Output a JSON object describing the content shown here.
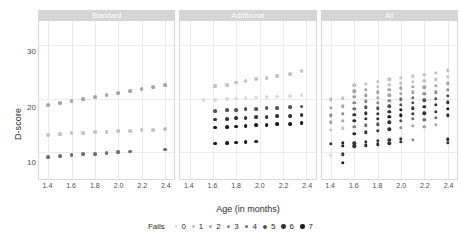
{
  "chart_data": {
    "type": "scatter",
    "title": "",
    "xlabel": "Age (in months)",
    "ylabel": "D-score",
    "xlim": [
      1.32,
      2.48
    ],
    "ylim": [
      5.0,
      34.5
    ],
    "xticks": [
      1.4,
      1.6,
      1.8,
      2.0,
      2.2,
      2.4
    ],
    "xtick_labels": [
      "1.4",
      "1.6",
      "1.8",
      "2.0",
      "2.2",
      "2.4"
    ],
    "yticks": [
      10,
      20,
      30
    ],
    "ytick_labels": [
      "10",
      "20",
      "30"
    ],
    "grid": true,
    "legend_position": "bottom",
    "legend_title": "Fails",
    "legend_entries": [
      "0",
      "1",
      "2",
      "3",
      "4",
      "5",
      "6",
      "7"
    ],
    "palette": [
      "#d9d9d9",
      "#c2c2c2",
      "#a3a3a3",
      "#8a8a8a",
      "#6e6e6e",
      "#525252",
      "#333333",
      "#1a1a1a"
    ],
    "facet_var": "item set",
    "facets": [
      {
        "label": "Standard",
        "points": [
          {
            "x": 1.4,
            "y": 18.8,
            "fails": 2
          },
          {
            "x": 1.5,
            "y": 19.1,
            "fails": 2
          },
          {
            "x": 1.6,
            "y": 19.5,
            "fails": 2
          },
          {
            "x": 1.7,
            "y": 19.9,
            "fails": 2
          },
          {
            "x": 1.8,
            "y": 20.3,
            "fails": 2
          },
          {
            "x": 1.9,
            "y": 20.7,
            "fails": 2
          },
          {
            "x": 2.0,
            "y": 21.0,
            "fails": 2
          },
          {
            "x": 2.1,
            "y": 21.4,
            "fails": 2
          },
          {
            "x": 2.2,
            "y": 21.8,
            "fails": 2
          },
          {
            "x": 2.3,
            "y": 22.2,
            "fails": 2
          },
          {
            "x": 2.4,
            "y": 22.6,
            "fails": 2
          },
          {
            "x": 1.4,
            "y": 13.2,
            "fails": 1
          },
          {
            "x": 1.5,
            "y": 13.4,
            "fails": 1
          },
          {
            "x": 1.6,
            "y": 13.5,
            "fails": 1
          },
          {
            "x": 1.7,
            "y": 13.6,
            "fails": 1
          },
          {
            "x": 1.8,
            "y": 13.7,
            "fails": 1
          },
          {
            "x": 1.9,
            "y": 13.8,
            "fails": 1
          },
          {
            "x": 2.0,
            "y": 13.9,
            "fails": 1
          },
          {
            "x": 2.1,
            "y": 14.0,
            "fails": 1
          },
          {
            "x": 2.2,
            "y": 14.1,
            "fails": 1
          },
          {
            "x": 2.3,
            "y": 14.2,
            "fails": 1
          },
          {
            "x": 2.4,
            "y": 14.3,
            "fails": 1
          },
          {
            "x": 1.4,
            "y": 9.1,
            "fails": 4
          },
          {
            "x": 1.5,
            "y": 9.3,
            "fails": 4
          },
          {
            "x": 1.6,
            "y": 9.4,
            "fails": 4
          },
          {
            "x": 1.7,
            "y": 9.6,
            "fails": 4
          },
          {
            "x": 1.8,
            "y": 9.7,
            "fails": 4
          },
          {
            "x": 1.9,
            "y": 9.9,
            "fails": 4
          },
          {
            "x": 2.0,
            "y": 10.0,
            "fails": 4
          },
          {
            "x": 2.1,
            "y": 10.1,
            "fails": 4
          },
          {
            "x": 2.4,
            "y": 10.5,
            "fails": 4
          }
        ]
      },
      {
        "label": "Additional",
        "points": [
          {
            "x": 1.62,
            "y": 22.3,
            "fails": 1
          },
          {
            "x": 1.72,
            "y": 22.6,
            "fails": 1
          },
          {
            "x": 1.8,
            "y": 23.0,
            "fails": 1
          },
          {
            "x": 1.88,
            "y": 23.3,
            "fails": 1
          },
          {
            "x": 1.97,
            "y": 23.6,
            "fails": 1
          },
          {
            "x": 2.06,
            "y": 23.9,
            "fails": 1
          },
          {
            "x": 2.15,
            "y": 24.2,
            "fails": 1
          },
          {
            "x": 2.26,
            "y": 24.6,
            "fails": 1
          },
          {
            "x": 2.36,
            "y": 25.1,
            "fails": 1
          },
          {
            "x": 1.52,
            "y": 19.7,
            "fails": 0
          },
          {
            "x": 1.62,
            "y": 19.8,
            "fails": 0
          },
          {
            "x": 1.72,
            "y": 19.9,
            "fails": 0
          },
          {
            "x": 1.8,
            "y": 20.0,
            "fails": 0
          },
          {
            "x": 1.88,
            "y": 20.1,
            "fails": 0
          },
          {
            "x": 1.97,
            "y": 20.2,
            "fails": 0
          },
          {
            "x": 2.06,
            "y": 20.3,
            "fails": 0
          },
          {
            "x": 2.15,
            "y": 20.4,
            "fails": 0
          },
          {
            "x": 2.26,
            "y": 20.5,
            "fails": 0
          },
          {
            "x": 2.36,
            "y": 20.6,
            "fails": 0
          },
          {
            "x": 1.62,
            "y": 17.7,
            "fails": 5
          },
          {
            "x": 1.72,
            "y": 17.8,
            "fails": 5
          },
          {
            "x": 1.8,
            "y": 17.9,
            "fails": 5
          },
          {
            "x": 1.88,
            "y": 18.0,
            "fails": 5
          },
          {
            "x": 1.97,
            "y": 18.1,
            "fails": 5
          },
          {
            "x": 2.06,
            "y": 18.2,
            "fails": 5
          },
          {
            "x": 2.15,
            "y": 18.3,
            "fails": 5
          },
          {
            "x": 2.26,
            "y": 18.4,
            "fails": 5
          },
          {
            "x": 2.36,
            "y": 18.5,
            "fails": 5
          },
          {
            "x": 1.62,
            "y": 16.1,
            "fails": 6
          },
          {
            "x": 1.72,
            "y": 16.2,
            "fails": 6
          },
          {
            "x": 1.8,
            "y": 16.3,
            "fails": 6
          },
          {
            "x": 1.88,
            "y": 16.4,
            "fails": 6
          },
          {
            "x": 1.97,
            "y": 16.5,
            "fails": 6
          },
          {
            "x": 2.06,
            "y": 16.6,
            "fails": 6
          },
          {
            "x": 2.15,
            "y": 16.7,
            "fails": 6
          },
          {
            "x": 2.26,
            "y": 16.8,
            "fails": 6
          },
          {
            "x": 2.36,
            "y": 16.9,
            "fails": 6
          },
          {
            "x": 1.62,
            "y": 14.6,
            "fails": 7
          },
          {
            "x": 1.72,
            "y": 14.7,
            "fails": 7
          },
          {
            "x": 1.8,
            "y": 14.8,
            "fails": 7
          },
          {
            "x": 1.88,
            "y": 14.9,
            "fails": 7
          },
          {
            "x": 1.97,
            "y": 15.0,
            "fails": 7
          },
          {
            "x": 2.06,
            "y": 15.1,
            "fails": 7
          },
          {
            "x": 2.15,
            "y": 15.2,
            "fails": 7
          },
          {
            "x": 2.26,
            "y": 15.3,
            "fails": 7
          },
          {
            "x": 2.36,
            "y": 15.4,
            "fails": 7
          },
          {
            "x": 1.62,
            "y": 11.6,
            "fails": 7
          },
          {
            "x": 1.72,
            "y": 11.7,
            "fails": 7
          },
          {
            "x": 1.8,
            "y": 11.8,
            "fails": 7
          },
          {
            "x": 1.88,
            "y": 11.9,
            "fails": 7
          },
          {
            "x": 1.97,
            "y": 12.0,
            "fails": 7
          }
        ]
      },
      {
        "label": "All",
        "points": [
          {
            "x": 1.4,
            "y": 19.9,
            "fails": 1
          },
          {
            "x": 1.4,
            "y": 18.3,
            "fails": 2
          },
          {
            "x": 1.4,
            "y": 16.9,
            "fails": 3
          },
          {
            "x": 1.4,
            "y": 15.6,
            "fails": 2
          },
          {
            "x": 1.4,
            "y": 14.2,
            "fails": 1
          },
          {
            "x": 1.4,
            "y": 11.6,
            "fails": 6
          },
          {
            "x": 1.4,
            "y": 9.4,
            "fails": 0
          },
          {
            "x": 1.5,
            "y": 20.1,
            "fails": 1
          },
          {
            "x": 1.5,
            "y": 18.6,
            "fails": 2
          },
          {
            "x": 1.5,
            "y": 17.2,
            "fails": 3
          },
          {
            "x": 1.5,
            "y": 15.9,
            "fails": 2
          },
          {
            "x": 1.5,
            "y": 14.5,
            "fails": 1
          },
          {
            "x": 1.5,
            "y": 11.8,
            "fails": 7
          },
          {
            "x": 1.5,
            "y": 11.2,
            "fails": 7
          },
          {
            "x": 1.5,
            "y": 9.6,
            "fails": 6
          },
          {
            "x": 1.5,
            "y": 8.0,
            "fails": 7
          },
          {
            "x": 1.6,
            "y": 22.5,
            "fails": 1
          },
          {
            "x": 1.6,
            "y": 21.4,
            "fails": 2
          },
          {
            "x": 1.6,
            "y": 20.3,
            "fails": 2
          },
          {
            "x": 1.6,
            "y": 19.2,
            "fails": 3
          },
          {
            "x": 1.6,
            "y": 18.1,
            "fails": 4
          },
          {
            "x": 1.6,
            "y": 17.0,
            "fails": 6
          },
          {
            "x": 1.6,
            "y": 15.9,
            "fails": 6
          },
          {
            "x": 1.6,
            "y": 14.7,
            "fails": 3
          },
          {
            "x": 1.6,
            "y": 13.4,
            "fails": 6
          },
          {
            "x": 1.6,
            "y": 11.7,
            "fails": 6
          },
          {
            "x": 1.6,
            "y": 11.1,
            "fails": 6
          },
          {
            "x": 1.7,
            "y": 22.8,
            "fails": 1
          },
          {
            "x": 1.7,
            "y": 21.7,
            "fails": 2
          },
          {
            "x": 1.7,
            "y": 20.6,
            "fails": 2
          },
          {
            "x": 1.7,
            "y": 19.5,
            "fails": 3
          },
          {
            "x": 1.7,
            "y": 18.4,
            "fails": 5
          },
          {
            "x": 1.7,
            "y": 17.3,
            "fails": 6
          },
          {
            "x": 1.7,
            "y": 16.2,
            "fails": 6
          },
          {
            "x": 1.7,
            "y": 15.0,
            "fails": 4
          },
          {
            "x": 1.7,
            "y": 13.7,
            "fails": 6
          },
          {
            "x": 1.7,
            "y": 11.9,
            "fails": 6
          },
          {
            "x": 1.7,
            "y": 11.3,
            "fails": 6
          },
          {
            "x": 1.8,
            "y": 23.2,
            "fails": 1
          },
          {
            "x": 1.8,
            "y": 22.2,
            "fails": 1
          },
          {
            "x": 1.8,
            "y": 21.2,
            "fails": 2
          },
          {
            "x": 1.8,
            "y": 20.2,
            "fails": 2
          },
          {
            "x": 1.8,
            "y": 19.2,
            "fails": 3
          },
          {
            "x": 1.8,
            "y": 18.2,
            "fails": 5
          },
          {
            "x": 1.8,
            "y": 17.2,
            "fails": 6
          },
          {
            "x": 1.8,
            "y": 16.2,
            "fails": 6
          },
          {
            "x": 1.8,
            "y": 15.2,
            "fails": 5
          },
          {
            "x": 1.8,
            "y": 14.0,
            "fails": 6
          },
          {
            "x": 1.8,
            "y": 12.1,
            "fails": 6
          },
          {
            "x": 1.8,
            "y": 11.5,
            "fails": 6
          },
          {
            "x": 1.9,
            "y": 23.6,
            "fails": 1
          },
          {
            "x": 1.9,
            "y": 22.6,
            "fails": 1
          },
          {
            "x": 1.9,
            "y": 21.6,
            "fails": 2
          },
          {
            "x": 1.9,
            "y": 20.6,
            "fails": 2
          },
          {
            "x": 1.9,
            "y": 19.6,
            "fails": 3
          },
          {
            "x": 1.9,
            "y": 18.6,
            "fails": 5
          },
          {
            "x": 1.9,
            "y": 17.6,
            "fails": 6
          },
          {
            "x": 1.9,
            "y": 16.6,
            "fails": 7
          },
          {
            "x": 1.9,
            "y": 15.6,
            "fails": 6
          },
          {
            "x": 1.9,
            "y": 14.3,
            "fails": 6
          },
          {
            "x": 1.9,
            "y": 12.3,
            "fails": 6
          },
          {
            "x": 1.9,
            "y": 11.7,
            "fails": 6
          },
          {
            "x": 2.0,
            "y": 23.9,
            "fails": 1
          },
          {
            "x": 2.0,
            "y": 22.9,
            "fails": 1
          },
          {
            "x": 2.0,
            "y": 21.9,
            "fails": 2
          },
          {
            "x": 2.0,
            "y": 20.9,
            "fails": 2
          },
          {
            "x": 2.0,
            "y": 19.9,
            "fails": 4
          },
          {
            "x": 2.0,
            "y": 18.9,
            "fails": 5
          },
          {
            "x": 2.0,
            "y": 17.9,
            "fails": 7
          },
          {
            "x": 2.0,
            "y": 16.9,
            "fails": 7
          },
          {
            "x": 2.0,
            "y": 15.9,
            "fails": 5
          },
          {
            "x": 2.0,
            "y": 14.6,
            "fails": 3
          },
          {
            "x": 2.0,
            "y": 12.5,
            "fails": 6
          },
          {
            "x": 2.0,
            "y": 11.9,
            "fails": 6
          },
          {
            "x": 2.1,
            "y": 24.2,
            "fails": 1
          },
          {
            "x": 2.1,
            "y": 23.2,
            "fails": 1
          },
          {
            "x": 2.1,
            "y": 22.2,
            "fails": 2
          },
          {
            "x": 2.1,
            "y": 21.2,
            "fails": 2
          },
          {
            "x": 2.1,
            "y": 20.2,
            "fails": 4
          },
          {
            "x": 2.1,
            "y": 19.2,
            "fails": 5
          },
          {
            "x": 2.1,
            "y": 18.2,
            "fails": 6
          },
          {
            "x": 2.1,
            "y": 17.2,
            "fails": 6
          },
          {
            "x": 2.1,
            "y": 16.2,
            "fails": 4
          },
          {
            "x": 2.1,
            "y": 14.9,
            "fails": 2
          },
          {
            "x": 2.1,
            "y": 12.3,
            "fails": 3
          },
          {
            "x": 2.2,
            "y": 24.5,
            "fails": 1
          },
          {
            "x": 2.2,
            "y": 23.3,
            "fails": 1
          },
          {
            "x": 2.2,
            "y": 22.1,
            "fails": 2
          },
          {
            "x": 2.2,
            "y": 20.9,
            "fails": 3
          },
          {
            "x": 2.2,
            "y": 19.7,
            "fails": 5
          },
          {
            "x": 2.2,
            "y": 18.5,
            "fails": 6
          },
          {
            "x": 2.2,
            "y": 17.3,
            "fails": 6
          },
          {
            "x": 2.2,
            "y": 16.1,
            "fails": 4
          },
          {
            "x": 2.2,
            "y": 14.8,
            "fails": 2
          },
          {
            "x": 2.3,
            "y": 24.8,
            "fails": 1
          },
          {
            "x": 2.3,
            "y": 23.6,
            "fails": 1
          },
          {
            "x": 2.3,
            "y": 22.4,
            "fails": 2
          },
          {
            "x": 2.3,
            "y": 21.2,
            "fails": 3
          },
          {
            "x": 2.3,
            "y": 20.0,
            "fails": 5
          },
          {
            "x": 2.3,
            "y": 18.8,
            "fails": 6
          },
          {
            "x": 2.3,
            "y": 17.6,
            "fails": 6
          },
          {
            "x": 2.3,
            "y": 16.4,
            "fails": 4
          },
          {
            "x": 2.3,
            "y": 15.1,
            "fails": 2
          },
          {
            "x": 2.4,
            "y": 25.3,
            "fails": 1
          },
          {
            "x": 2.4,
            "y": 24.1,
            "fails": 1
          },
          {
            "x": 2.4,
            "y": 22.9,
            "fails": 2
          },
          {
            "x": 2.4,
            "y": 21.7,
            "fails": 3
          },
          {
            "x": 2.4,
            "y": 20.5,
            "fails": 5
          },
          {
            "x": 2.4,
            "y": 19.3,
            "fails": 6
          },
          {
            "x": 2.4,
            "y": 18.1,
            "fails": 7
          },
          {
            "x": 2.4,
            "y": 16.9,
            "fails": 6
          },
          {
            "x": 2.4,
            "y": 12.4,
            "fails": 6
          },
          {
            "x": 2.4,
            "y": 11.8,
            "fails": 6
          }
        ]
      }
    ]
  }
}
